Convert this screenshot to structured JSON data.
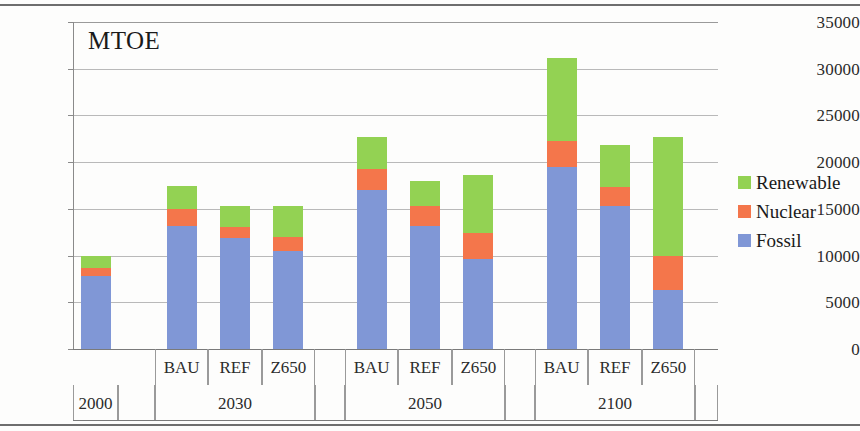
{
  "chart_data": {
    "type": "bar",
    "subtype": "stacked",
    "title": "MTOE",
    "xlabel": "",
    "ylabel": "MTOE",
    "ylim": [
      0,
      35000
    ],
    "ytick_step": 5000,
    "yticks": [
      "35000",
      "30000",
      "25000",
      "20000",
      "15000",
      "10000",
      "5000",
      "0"
    ],
    "grid": true,
    "legend_position": "right",
    "categories": [
      "2000",
      "2030 BAU",
      "2030 REF",
      "2030 Z650",
      "2050 BAU",
      "2050 REF",
      "2050 Z650",
      "2100 BAU",
      "2100 REF",
      "2100 Z650"
    ],
    "groups": [
      {
        "year": "2000",
        "scenarios": [
          {
            "label": "",
            "fossil": 7800,
            "nuclear": 900,
            "renewable": 1300,
            "total": 10000
          }
        ]
      },
      {
        "year": "2030",
        "scenarios": [
          {
            "label": "BAU",
            "fossil": 13200,
            "nuclear": 1800,
            "renewable": 2400,
            "total": 17400
          },
          {
            "label": "REF",
            "fossil": 11900,
            "nuclear": 1200,
            "renewable": 2200,
            "total": 15300
          },
          {
            "label": "Z650",
            "fossil": 10500,
            "nuclear": 1500,
            "renewable": 3300,
            "total": 15300
          }
        ]
      },
      {
        "year": "2050",
        "scenarios": [
          {
            "label": "BAU",
            "fossil": 17000,
            "nuclear": 2300,
            "renewable": 3400,
            "total": 22700
          },
          {
            "label": "REF",
            "fossil": 13200,
            "nuclear": 2100,
            "renewable": 2700,
            "total": 18000
          },
          {
            "label": "Z650",
            "fossil": 9600,
            "nuclear": 2800,
            "renewable": 6200,
            "total": 18600
          }
        ]
      },
      {
        "year": "2100",
        "scenarios": [
          {
            "label": "BAU",
            "fossil": 19500,
            "nuclear": 2800,
            "renewable": 8800,
            "total": 31100
          },
          {
            "label": "REF",
            "fossil": 15300,
            "nuclear": 2000,
            "renewable": 4500,
            "total": 21800
          },
          {
            "label": "Z650",
            "fossil": 6300,
            "nuclear": 3700,
            "renewable": 12700,
            "total": 22700
          }
        ]
      }
    ],
    "series": [
      {
        "name": "Renewable",
        "color": "#93d253",
        "values": [
          1300,
          2400,
          2200,
          3300,
          3400,
          2700,
          6200,
          8800,
          4500,
          12700
        ]
      },
      {
        "name": "Nuclear",
        "color": "#f4764b",
        "values": [
          900,
          1800,
          1200,
          1500,
          2300,
          2100,
          2800,
          2800,
          2000,
          3700
        ]
      },
      {
        "name": "Fossil",
        "color": "#8097d6",
        "values": [
          7800,
          13200,
          11900,
          10500,
          17000,
          13200,
          9600,
          19500,
          15300,
          6300
        ]
      }
    ]
  },
  "legend": {
    "items": [
      {
        "label": "Renewable",
        "color": "#93d253"
      },
      {
        "label": "Nuclear",
        "color": "#f4764b"
      },
      {
        "label": "Fossil",
        "color": "#8097d6"
      }
    ]
  },
  "axis": {
    "unit_title": "MTOE"
  }
}
